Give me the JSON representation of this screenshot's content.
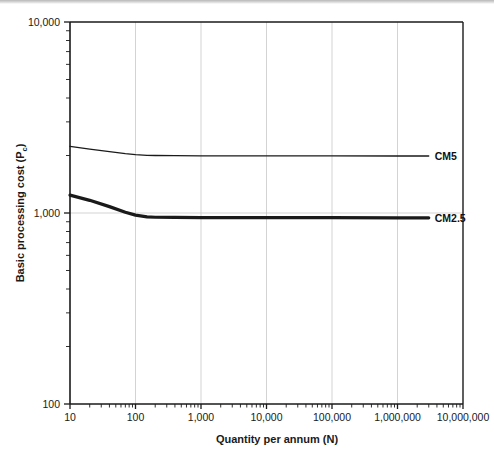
{
  "figure": {
    "background_color": "#ffffff",
    "ink_color": "#1a1a1a",
    "grid_color": "#c8c8c8"
  },
  "chart_data": {
    "type": "line",
    "title": "",
    "subtitle": "",
    "xlabel": "Quantity per annum (N)",
    "ylabel": "Basic processing cost (P",
    "ylabel_sub": "c",
    "ylabel_suffix": ")",
    "xscale": "log",
    "yscale": "log",
    "xlim": [
      10,
      10000000
    ],
    "ylim": [
      100,
      10000
    ],
    "grid": true,
    "grid_axis": "both-major",
    "legend_position": "inline-right-of-curve",
    "xticks": [
      10,
      100,
      1000,
      10000,
      100000,
      1000000,
      10000000
    ],
    "xticklabels": [
      "10",
      "100",
      "1,000",
      "10,000",
      "100,000",
      "1,000,000",
      "10,000,000"
    ],
    "yticks": [
      100,
      1000,
      10000
    ],
    "yticklabels": [
      "100",
      "1,000",
      "10,000"
    ],
    "minor_ticks": true,
    "series": [
      {
        "name": "CM5",
        "label": "CM5",
        "color": "#1a1a1a",
        "linewidth": 1.3,
        "x": [
          10,
          20,
          40,
          70,
          100,
          150,
          200,
          400,
          1000,
          10000,
          100000,
          1000000,
          3000000
        ],
        "y": [
          2230,
          2160,
          2095,
          2045,
          2020,
          2005,
          2000,
          1995,
          1992,
          1990,
          1990,
          1988,
          1988
        ]
      },
      {
        "name": "CM2.5",
        "label": "CM2.5",
        "color": "#1a1a1a",
        "linewidth": 3.2,
        "x": [
          10,
          20,
          40,
          70,
          100,
          150,
          200,
          400,
          1000,
          10000,
          100000,
          1000000,
          3000000
        ],
        "y": [
          1240,
          1165,
          1080,
          1010,
          975,
          955,
          950,
          948,
          946,
          945,
          945,
          944,
          944
        ]
      }
    ]
  }
}
